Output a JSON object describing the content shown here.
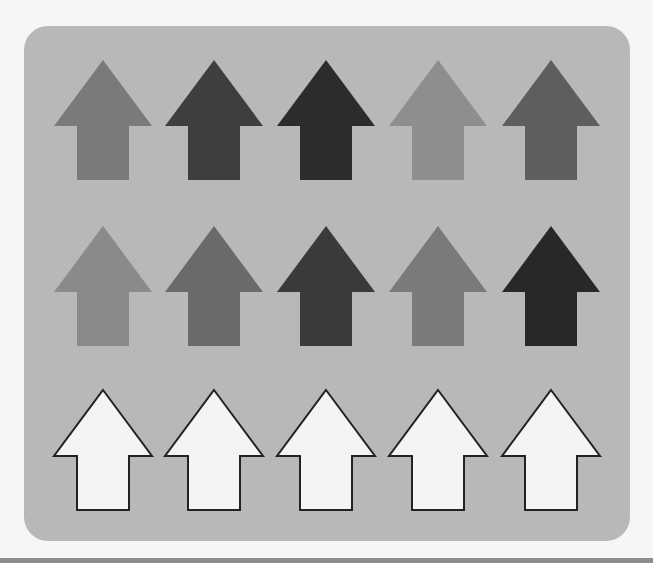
{
  "rows": [
    {
      "name": "row-1",
      "arrows": [
        {
          "direction": "up",
          "fill": "#7a7a7a",
          "outlined": false
        },
        {
          "direction": "up",
          "fill": "#3e3e3e",
          "outlined": false
        },
        {
          "direction": "up",
          "fill": "#2c2c2c",
          "outlined": false
        },
        {
          "direction": "up",
          "fill": "#8e8e8e",
          "outlined": false
        },
        {
          "direction": "up",
          "fill": "#5e5e5e",
          "outlined": false
        }
      ]
    },
    {
      "name": "row-2",
      "arrows": [
        {
          "direction": "up",
          "fill": "#8a8a8a",
          "outlined": false
        },
        {
          "direction": "up",
          "fill": "#6a6a6a",
          "outlined": false
        },
        {
          "direction": "up",
          "fill": "#3a3a3a",
          "outlined": false
        },
        {
          "direction": "up",
          "fill": "#7a7a7a",
          "outlined": false
        },
        {
          "direction": "up",
          "fill": "#282828",
          "outlined": false
        }
      ]
    },
    {
      "name": "row-3",
      "arrows": [
        {
          "direction": "up",
          "fill": "#f4f4f4",
          "outlined": true,
          "stroke": "#222222"
        },
        {
          "direction": "up",
          "fill": "#f4f4f4",
          "outlined": true,
          "stroke": "#222222"
        },
        {
          "direction": "up",
          "fill": "#f4f4f4",
          "outlined": true,
          "stroke": "#222222"
        },
        {
          "direction": "up",
          "fill": "#f4f4f4",
          "outlined": true,
          "stroke": "#222222"
        },
        {
          "direction": "up",
          "fill": "#f4f4f4",
          "outlined": true,
          "stroke": "#222222"
        }
      ]
    }
  ],
  "colors": {
    "page_background": "#f6f6f6",
    "panel_background": "#b8b8b8",
    "bottom_strip": "#8e8e8e"
  }
}
